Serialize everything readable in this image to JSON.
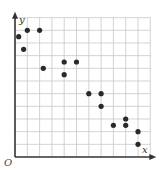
{
  "chart_data": {
    "type": "scatter",
    "title": "",
    "xlabel": "x",
    "ylabel": "y",
    "origin_label": "O",
    "xlim": [
      0,
      11
    ],
    "ylim": [
      0,
      11
    ],
    "grid": true,
    "grid_step": 1,
    "tick_labels_shown": false,
    "legend": null,
    "series": [
      {
        "name": "points",
        "points": [
          {
            "x": 0.3,
            "y": 9.5
          },
          {
            "x": 1,
            "y": 10
          },
          {
            "x": 2,
            "y": 10
          },
          {
            "x": 0.7,
            "y": 8.5
          },
          {
            "x": 2.3,
            "y": 7
          },
          {
            "x": 4,
            "y": 7.5
          },
          {
            "x": 5,
            "y": 7.5
          },
          {
            "x": 4,
            "y": 6.5
          },
          {
            "x": 6,
            "y": 5
          },
          {
            "x": 7,
            "y": 5
          },
          {
            "x": 7,
            "y": 4
          },
          {
            "x": 8,
            "y": 2.5
          },
          {
            "x": 9,
            "y": 3
          },
          {
            "x": 9,
            "y": 2.5
          },
          {
            "x": 10,
            "y": 2
          },
          {
            "x": 10,
            "y": 1
          }
        ]
      }
    ]
  },
  "colors": {
    "grid": "#c8c8c8",
    "axis": "#333333",
    "point": "#2a2a2a",
    "background": "#ffffff"
  }
}
